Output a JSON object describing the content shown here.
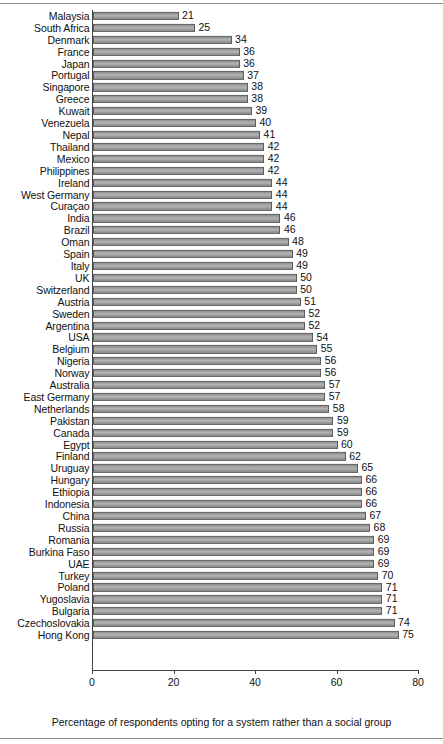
{
  "chart_data": {
    "type": "bar",
    "orientation": "horizontal",
    "title": "",
    "xlabel": "Percentage of respondents opting for a system rather than a social group",
    "ylabel": "",
    "xlim": [
      0,
      80
    ],
    "xticks": [
      0,
      20,
      40,
      60,
      80
    ],
    "grid": false,
    "legend": null,
    "categories": [
      "Malaysia",
      "South Africa",
      "Denmark",
      "France",
      "Japan",
      "Portugal",
      "Singapore",
      "Greece",
      "Kuwait",
      "Venezuela",
      "Nepal",
      "Thailand",
      "Mexico",
      "Philippines",
      "Ireland",
      "West Germany",
      "Curaçao",
      "India",
      "Brazil",
      "Oman",
      "Spain",
      "Italy",
      "UK",
      "Switzerland",
      "Austria",
      "Sweden",
      "Argentina",
      "USA",
      "Belgium",
      "Nigeria",
      "Norway",
      "Australia",
      "East Germany",
      "Netherlands",
      "Pakistan",
      "Canada",
      "Egypt",
      "Finland",
      "Uruguay",
      "Hungary",
      "Ethiopia",
      "Indonesia",
      "China",
      "Russia",
      "Romania",
      "Burkina Faso",
      "UAE",
      "Turkey",
      "Poland",
      "Yugoslavia",
      "Bulgaria",
      "Czechoslovakia",
      "Hong Kong"
    ],
    "values": [
      21,
      25,
      34,
      36,
      36,
      37,
      38,
      38,
      39,
      40,
      41,
      42,
      42,
      42,
      44,
      44,
      44,
      46,
      46,
      48,
      49,
      49,
      50,
      50,
      51,
      52,
      52,
      54,
      55,
      56,
      56,
      57,
      57,
      58,
      59,
      59,
      60,
      62,
      65,
      66,
      66,
      66,
      67,
      68,
      69,
      69,
      69,
      70,
      71,
      71,
      71,
      74,
      75
    ]
  },
  "axis": {
    "tick_labels": [
      "0",
      "20",
      "40",
      "60",
      "80"
    ],
    "title": "Percentage of respondents opting for a system rather than a social group"
  },
  "style": {
    "bar_fill": "#a9a9a9",
    "bar_stroke": "#5c5c5c",
    "axis_color": "#444444",
    "rule_color": "#8d8d8d",
    "text_color": "#111111",
    "background": "#ffffff"
  }
}
